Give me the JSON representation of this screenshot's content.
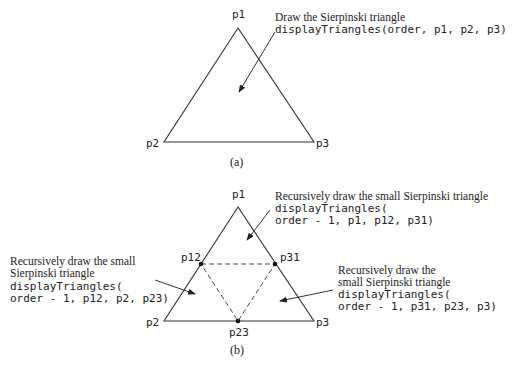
{
  "panel_a": {
    "caption": "(a)",
    "vertices": {
      "p1": "p1",
      "p2": "p2",
      "p3": "p3"
    },
    "annotation": {
      "line1": "Draw the Sierpinski triangle",
      "line2": "displayTriangles(order, p1, p2, p3)"
    }
  },
  "panel_b": {
    "caption": "(b)",
    "vertices": {
      "p1": "p1",
      "p2": "p2",
      "p3": "p3",
      "p12": "p12",
      "p31": "p31",
      "p23": "p23"
    },
    "annotation_top": {
      "line1": "Recursively draw the small Sierpinski triangle",
      "line2": "displayTriangles(",
      "line3": "order - 1, p1, p12, p31)"
    },
    "annotation_left": {
      "line1": "Recursively draw the small",
      "line2": "Sierpinski triangle",
      "line3": "displayTriangles(",
      "line4": "order - 1, p12, p2, p23)"
    },
    "annotation_right": {
      "line1": "Recursively draw the",
      "line2": "small Sierpinski triangle",
      "line3": "displayTriangles(",
      "line4": "order - 1, p31, p23, p3)"
    }
  }
}
